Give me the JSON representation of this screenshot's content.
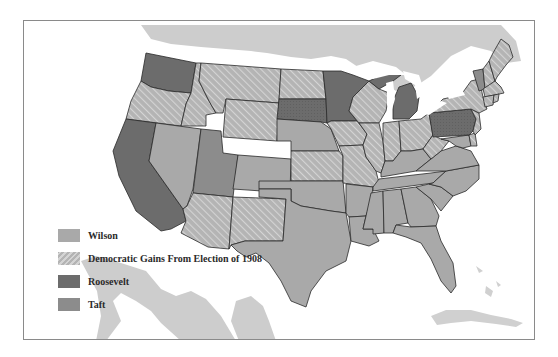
{
  "map": {
    "title": "",
    "colors": {
      "wilson": "#a9a9a9",
      "democratic_gains_base": "#b4b4b4",
      "democratic_gains_stripe": "#d2d2d2",
      "roosevelt": "#6c6c6c",
      "taft": "#8c8c8c",
      "neighbor_land": "#cdcdcd",
      "water": "#ffffff"
    },
    "states": {
      "Washington": "roosevelt",
      "Oregon": "dem_gain",
      "California": "roosevelt",
      "Idaho": "dem_gain",
      "Nevada": "wilson",
      "Utah": "taft",
      "Arizona": "dem_gain",
      "Montana": "dem_gain",
      "Wyoming": "dem_gain",
      "Colorado": "wilson",
      "New Mexico": "dem_gain",
      "North Dakota": "dem_gain",
      "South Dakota": "roosevelt",
      "Nebraska": "wilson",
      "Kansas": "dem_gain",
      "Oklahoma": "wilson",
      "Texas": "wilson",
      "Minnesota": "roosevelt",
      "Iowa": "dem_gain",
      "Missouri": "dem_gain",
      "Arkansas": "wilson",
      "Louisiana": "wilson",
      "Wisconsin": "dem_gain",
      "Illinois": "dem_gain",
      "Michigan": "roosevelt",
      "Indiana": "dem_gain",
      "Ohio": "dem_gain",
      "Kentucky": "wilson",
      "Tennessee": "wilson",
      "Mississippi": "wilson",
      "Alabama": "wilson",
      "Georgia": "wilson",
      "Florida": "wilson",
      "South Carolina": "wilson",
      "North Carolina": "wilson",
      "Virginia": "wilson",
      "West Virginia": "dem_gain",
      "Maryland": "wilson",
      "Delaware": "dem_gain",
      "Pennsylvania": "roosevelt",
      "New Jersey": "dem_gain",
      "New York": "dem_gain",
      "Vermont": "taft",
      "New Hampshire": "dem_gain",
      "Maine": "dem_gain",
      "Massachusetts": "dem_gain",
      "Connecticut": "dem_gain",
      "Rhode Island": "dem_gain"
    }
  },
  "legend": {
    "items": [
      {
        "key": "wilson",
        "label": "Wilson"
      },
      {
        "key": "dem_gain",
        "label": "Democratic Gains From Election of 1908"
      },
      {
        "key": "roosevelt",
        "label": "Roosevelt"
      },
      {
        "key": "taft",
        "label": "Taft"
      }
    ]
  }
}
